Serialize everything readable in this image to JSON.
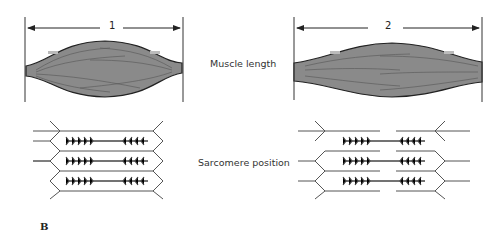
{
  "figure": {
    "panel_label": "B",
    "row_labels": {
      "muscle": "Muscle length",
      "sarcomere": "Sarcomere position"
    },
    "states": [
      {
        "id": "1",
        "length_label": "1",
        "state": "shortened"
      },
      {
        "id": "2",
        "length_label": "2",
        "state": "stretched"
      }
    ],
    "colors": {
      "muscle_fill": "#8a8a8a",
      "outline": "#222222",
      "line": "#555555",
      "filament": "#444444"
    }
  }
}
